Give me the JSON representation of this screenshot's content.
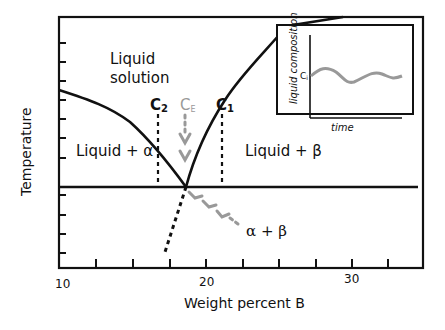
{
  "diagram": {
    "type": "binary eutectic phase diagram",
    "x_axis": {
      "label": "Weight percent B",
      "tick_labels": [
        "10",
        "20",
        "30"
      ],
      "minor_tick_count": 9
    },
    "y_axis": {
      "label": "Temperature",
      "tick_count": 10
    },
    "regions": {
      "liquid_line1": "Liquid",
      "liquid_line2": "solution",
      "liquid_alpha": "Liquid + α",
      "liquid_beta": "Liquid + β",
      "alpha_beta": "α + β"
    },
    "markers": {
      "c2": "C",
      "c2_sub": "2",
      "ce": "C",
      "ce_sub": "E",
      "c1": "C",
      "c1_sub": "1"
    },
    "inset": {
      "y_label": "liquid composition",
      "x_label": "time",
      "level_label": "C",
      "level_sub": "i"
    },
    "colors": {
      "line": "#111111",
      "highlight": "#999999"
    }
  }
}
